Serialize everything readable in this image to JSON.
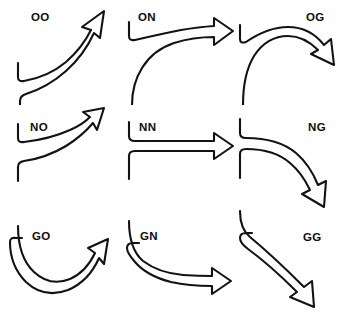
{
  "figure": {
    "background_color": "#ffffff",
    "stroke_color": "#121212",
    "label_color": "#0d0d0d",
    "rows": 3,
    "columns": 3
  },
  "legend": {
    "code_meaning": "first letter = entry direction, second letter = exit direction",
    "codes": [
      "O",
      "N",
      "G"
    ]
  },
  "cells": [
    {
      "id": "cell-oo",
      "label": "OO",
      "row": 1,
      "column": 1,
      "entry": "O",
      "exit": "O",
      "head_direction": "up-right",
      "label_x": 31,
      "label_y": 12
    },
    {
      "id": "cell-on",
      "label": "ON",
      "row": 1,
      "column": 2,
      "entry": "O",
      "exit": "N",
      "head_direction": "right",
      "label_x": 138,
      "label_y": 12
    },
    {
      "id": "cell-og",
      "label": "OG",
      "row": 1,
      "column": 3,
      "entry": "O",
      "exit": "G",
      "head_direction": "down-right",
      "label_x": 306,
      "label_y": 12
    },
    {
      "id": "cell-no",
      "label": "NO",
      "row": 2,
      "column": 1,
      "entry": "N",
      "exit": "O",
      "head_direction": "up-right",
      "label_x": 30,
      "label_y": 122
    },
    {
      "id": "cell-nn",
      "label": "NN",
      "row": 2,
      "column": 2,
      "entry": "N",
      "exit": "N",
      "head_direction": "right",
      "label_x": 139,
      "label_y": 122
    },
    {
      "id": "cell-ng",
      "label": "NG",
      "row": 2,
      "column": 3,
      "entry": "N",
      "exit": "G",
      "head_direction": "down-right",
      "label_x": 308,
      "label_y": 122
    },
    {
      "id": "cell-go",
      "label": "GO",
      "row": 3,
      "column": 1,
      "entry": "G",
      "exit": "O",
      "head_direction": "up-right",
      "label_x": 32,
      "label_y": 231
    },
    {
      "id": "cell-gn",
      "label": "GN",
      "row": 3,
      "column": 2,
      "entry": "G",
      "exit": "N",
      "head_direction": "right",
      "label_x": 140,
      "label_y": 231
    },
    {
      "id": "cell-gg",
      "label": "GG",
      "row": 3,
      "column": 3,
      "entry": "G",
      "exit": "G",
      "head_direction": "down-right",
      "label_x": 303,
      "label_y": 232
    }
  ]
}
